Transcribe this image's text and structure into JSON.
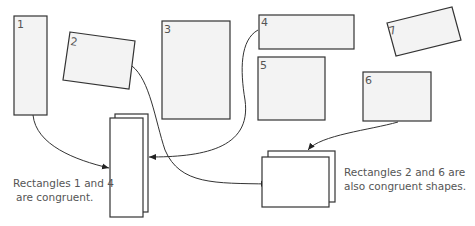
{
  "diagram": {
    "rectangles": [
      {
        "id": "1",
        "label": "1"
      },
      {
        "id": "2",
        "label": "2"
      },
      {
        "id": "3",
        "label": "3"
      },
      {
        "id": "4",
        "label": "4"
      },
      {
        "id": "5",
        "label": "5"
      },
      {
        "id": "6",
        "label": "6"
      },
      {
        "id": "7",
        "label": "7"
      }
    ],
    "captions": {
      "left_line1": "Rectangles 1 and 4",
      "left_line2": "are congruent.",
      "right_line1": "Rectangles 2 and 6 are",
      "right_line2": "also congruent shapes."
    },
    "colors": {
      "shape_fill": "#f3f3f3",
      "stroke": "#333333",
      "text": "#555555"
    }
  }
}
